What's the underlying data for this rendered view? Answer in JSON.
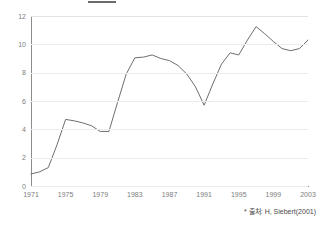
{
  "chart_data": {
    "type": "line",
    "title": "",
    "xlabel": "",
    "ylabel": "",
    "x": [
      1971,
      1972,
      1973,
      1974,
      1975,
      1976,
      1977,
      1978,
      1979,
      1980,
      1981,
      1982,
      1983,
      1984,
      1985,
      1986,
      1987,
      1988,
      1989,
      1990,
      1991,
      1992,
      1993,
      1994,
      1995,
      1996,
      1997,
      1998,
      1999,
      2000,
      2001,
      2002,
      2003
    ],
    "values": [
      0.85,
      1.0,
      1.3,
      2.9,
      4.7,
      4.6,
      4.45,
      4.25,
      3.85,
      3.85,
      5.9,
      7.9,
      9.05,
      9.1,
      9.25,
      9.0,
      8.85,
      8.5,
      7.9,
      7.0,
      5.7,
      7.2,
      8.6,
      9.4,
      9.25,
      10.3,
      11.25,
      10.75,
      10.2,
      9.7,
      9.55,
      9.7,
      10.3
    ],
    "series": [
      {
        "name": "series-1",
        "values": [
          0.85,
          1.0,
          1.3,
          2.9,
          4.7,
          4.6,
          4.45,
          4.25,
          3.85,
          3.85,
          5.9,
          7.9,
          9.05,
          9.1,
          9.25,
          9.0,
          8.85,
          8.5,
          7.9,
          7.0,
          5.7,
          7.2,
          8.6,
          9.4,
          9.25,
          10.3,
          11.25,
          10.75,
          10.2,
          9.7,
          9.55,
          9.7,
          10.3
        ],
        "color": "#6e6e6e"
      }
    ],
    "xlim": [
      1971,
      2003
    ],
    "ylim": [
      0,
      12
    ],
    "y_ticks": [
      0,
      2,
      4,
      6,
      8,
      10,
      12
    ],
    "y_tick_labels": [
      "0",
      "2",
      "4",
      "6",
      "8",
      "10",
      "12"
    ],
    "x_ticks": [
      1971,
      1975,
      1979,
      1983,
      1987,
      1991,
      1995,
      1999,
      2003
    ],
    "x_tick_labels": [
      "1971",
      "1975",
      "1979",
      "1983",
      "1987",
      "1991",
      "1995",
      "1999",
      "2003"
    ],
    "grid": true,
    "grid_axis": "y",
    "legend": false,
    "legend_position": "none",
    "line_color": "#6e6e6e",
    "grid_color": "#ebebeb",
    "axis_color": "#8c8c8c",
    "tick_label_color": "#7d7d7d",
    "background": "#ffffff",
    "markers": false
  },
  "footer": {
    "asterisk": "*",
    "source_note": "출처: H, Siebert(2001)"
  },
  "header": {
    "title": ""
  }
}
